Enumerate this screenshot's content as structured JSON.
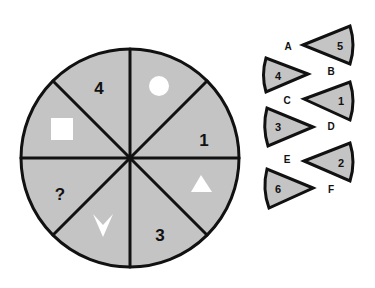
{
  "puzzle": {
    "colors": {
      "segment_fill": "#c4c4c4",
      "stroke": "#111111",
      "symbol_fill": "#ffffff",
      "background": "#ffffff"
    },
    "wheel": {
      "segments": [
        {
          "position": "top-right",
          "content_type": "symbol",
          "symbol": "circle"
        },
        {
          "position": "right-upper",
          "content_type": "number",
          "value": "1"
        },
        {
          "position": "right-lower",
          "content_type": "symbol",
          "symbol": "triangle"
        },
        {
          "position": "bottom-right",
          "content_type": "number",
          "value": "3"
        },
        {
          "position": "bottom-left",
          "content_type": "symbol",
          "symbol": "chevron-down"
        },
        {
          "position": "left-lower",
          "content_type": "unknown",
          "value": "?"
        },
        {
          "position": "left-upper",
          "content_type": "symbol",
          "symbol": "square"
        },
        {
          "position": "top-left",
          "content_type": "number",
          "value": "4"
        }
      ]
    },
    "options": [
      {
        "letter": "A",
        "number": "4",
        "direction": "points-right"
      },
      {
        "letter": "B",
        "number": "5",
        "direction": "points-left"
      },
      {
        "letter": "C",
        "number": "1",
        "direction": "points-left"
      },
      {
        "letter": "D",
        "number": "3",
        "direction": "points-right"
      },
      {
        "letter": "E",
        "number": "2",
        "direction": "points-left"
      },
      {
        "letter": "F",
        "number": "6",
        "direction": "points-right"
      }
    ]
  }
}
